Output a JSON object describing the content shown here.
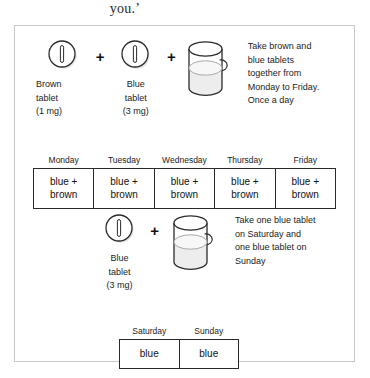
{
  "document_fragment": "you.’",
  "figure": {
    "regimen_weekday": {
      "items": [
        {
          "icon": "tablet-icon",
          "color_name": "Brown",
          "caption": "Brown\ntablet\n(1 mg)"
        },
        {
          "icon": "plus-icon",
          "symbol": "+"
        },
        {
          "icon": "tablet-icon",
          "color_name": "Blue",
          "caption": "Blue\ntablet\n(3 mg)"
        },
        {
          "icon": "plus-icon",
          "symbol": "+"
        },
        {
          "icon": "cup-of-water-icon"
        }
      ],
      "instruction": "Take brown and\nblue tablets\ntogether from\nMonday to Friday.\nOnce a day",
      "table": {
        "headers": [
          "Monday",
          "Tuesday",
          "Wednesday",
          "Thursday",
          "Friday"
        ],
        "cells": [
          "blue +\nbrown",
          "blue +\nbrown",
          "blue +\nbrown",
          "blue +\nbrown",
          "blue +\nbrown"
        ]
      }
    },
    "regimen_weekend": {
      "items": [
        {
          "icon": "tablet-icon",
          "color_name": "Blue",
          "caption": "Blue\ntablet\n(3 mg)"
        },
        {
          "icon": "plus-icon",
          "symbol": "+"
        },
        {
          "icon": "cup-of-water-icon"
        }
      ],
      "instruction": "Take one blue tablet\non Saturday and\none blue tablet on\nSunday",
      "table": {
        "headers": [
          "Saturday",
          "Sunday"
        ],
        "cells": [
          "blue",
          "blue"
        ]
      }
    }
  },
  "colors": {
    "frame_border": "#c9c9c9",
    "table_border": "#2a2a2a",
    "text": "#1b1b1b",
    "icon_outline": "#2b2b2b",
    "liquid_fill": "#ededed",
    "shadow": "#cfcfcf"
  }
}
